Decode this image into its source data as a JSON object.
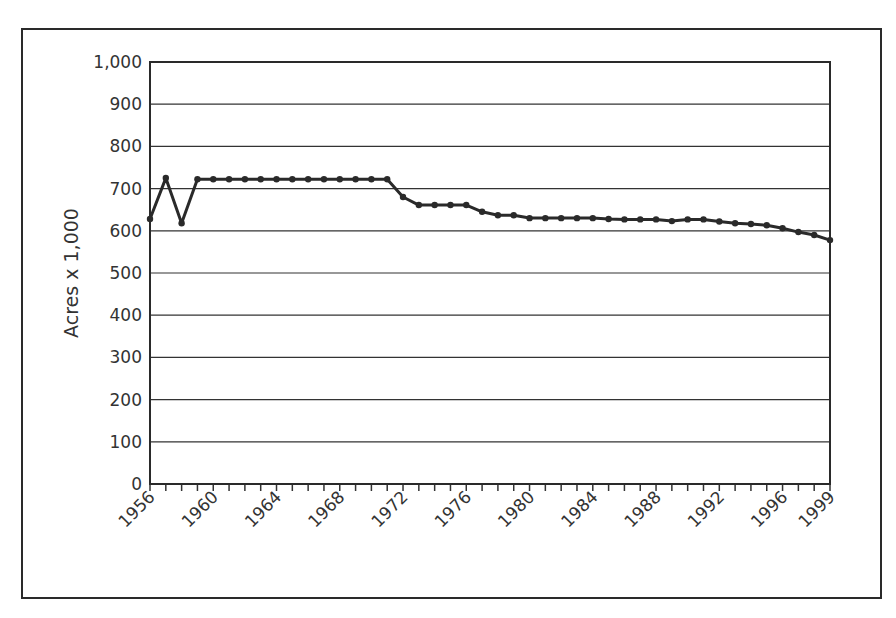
{
  "chart_data": {
    "type": "line",
    "title": "",
    "xlabel": "",
    "ylabel": "Acres x 1,000",
    "ylim": [
      0,
      1000
    ],
    "xlim": [
      1956,
      1999
    ],
    "grid": "horizontal",
    "legend": null,
    "y_ticks": [
      0,
      100,
      200,
      300,
      400,
      500,
      600,
      700,
      800,
      900,
      1000
    ],
    "y_tick_labels": [
      "0",
      "100",
      "200",
      "300",
      "400",
      "500",
      "600",
      "700",
      "800",
      "900",
      "1,000"
    ],
    "x_tick_labels": [
      "1956",
      "1960",
      "1964",
      "1968",
      "1972",
      "1976",
      "1980",
      "1984",
      "1988",
      "1992",
      "1996",
      "1999"
    ],
    "x": [
      1956,
      1957,
      1958,
      1959,
      1960,
      1961,
      1962,
      1963,
      1964,
      1965,
      1966,
      1967,
      1968,
      1969,
      1970,
      1971,
      1972,
      1973,
      1974,
      1975,
      1976,
      1977,
      1978,
      1979,
      1980,
      1981,
      1982,
      1983,
      1984,
      1985,
      1986,
      1987,
      1988,
      1989,
      1990,
      1991,
      1992,
      1993,
      1994,
      1995,
      1996,
      1997,
      1998,
      1999
    ],
    "series": [
      {
        "name": "Acres",
        "values": [
          628,
          725,
          618,
          722,
          722,
          722,
          722,
          722,
          722,
          722,
          722,
          722,
          722,
          722,
          722,
          722,
          680,
          661,
          661,
          661,
          661,
          645,
          637,
          637,
          630,
          630,
          630,
          630,
          630,
          628,
          627,
          627,
          627,
          623,
          627,
          627,
          622,
          618,
          616,
          613,
          606,
          597,
          590,
          578
        ]
      }
    ]
  },
  "colors": {
    "line": "#2a2a2a",
    "grid": "#333333",
    "frame": "#2a2a2a",
    "text": "#333333"
  }
}
